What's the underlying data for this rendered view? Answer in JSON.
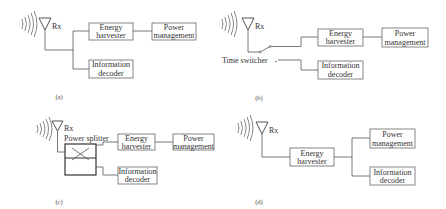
{
  "panels": [
    {
      "id": "a",
      "caption": "(a)",
      "antenna_label": "Rx",
      "blocks": {
        "energy_harvester": [
          "Energy",
          "harvester"
        ],
        "power_management": [
          "Power",
          "management"
        ],
        "information_decoder": [
          "Information",
          "decoder"
        ]
      }
    },
    {
      "id": "b",
      "caption": "(b)",
      "antenna_label": "Rx",
      "switch_label": "Time switcher",
      "blocks": {
        "energy_harvester": [
          "Energy",
          "harvester"
        ],
        "power_management": [
          "Power",
          "management"
        ],
        "information_decoder": [
          "Information",
          "decoder"
        ]
      }
    },
    {
      "id": "c",
      "caption": "(c)",
      "antenna_label": "Rx",
      "splitter_label": "Power splitter",
      "blocks": {
        "energy_harvester": [
          "Energy",
          "harvester"
        ],
        "power_management": [
          "Power",
          "management"
        ],
        "information_decoder": [
          "Information",
          "decoder"
        ]
      }
    },
    {
      "id": "d",
      "caption": "(d)",
      "antenna_label": "Rx",
      "blocks": {
        "energy_harvester": [
          "Energy",
          "harvester"
        ],
        "power_management": [
          "Power",
          "management"
        ],
        "information_decoder": [
          "Information",
          "decoder"
        ]
      }
    }
  ],
  "colors": {
    "line": "#555555",
    "box_border": "#666666",
    "text": "#333333",
    "background": "#ffffff"
  }
}
